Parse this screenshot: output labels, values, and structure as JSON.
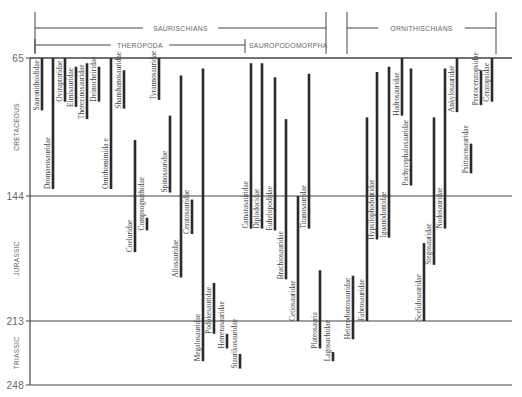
{
  "chart_data": {
    "type": "range-bar",
    "title": "",
    "xlabel": "",
    "ylabel": "Millions of years ago",
    "ylim": [
      65,
      248
    ],
    "y_ticks": [
      65,
      144,
      213,
      248
    ],
    "periods": [
      {
        "name": "CRETACEOUS",
        "from": 65,
        "to": 144
      },
      {
        "name": "JURASSIC",
        "from": 144,
        "to": 213
      },
      {
        "name": "TRIASSIC",
        "from": 213,
        "to": 248
      }
    ],
    "groups": [
      {
        "name": "SAURISCHIANS",
        "x_from": 35,
        "x_to": 326,
        "level": 1
      },
      {
        "name": "THEROPODA",
        "x_from": 35,
        "x_to": 245,
        "level": 2
      },
      {
        "name": "SAUROPODOMORPHA",
        "x_from": 245,
        "x_to": 326,
        "level": 2
      },
      {
        "name": "ORNITHISCHIANS",
        "x_from": 347,
        "x_to": 496,
        "level": 1
      }
    ],
    "families": [
      {
        "name": "Sauronithoididae",
        "x": 42,
        "from": 65,
        "to": 95,
        "group": "THEROPODA"
      },
      {
        "name": "Dromaeosauridae",
        "x": 53,
        "from": 65,
        "to": 140,
        "group": "THEROPODA"
      },
      {
        "name": "Oviraptoridae",
        "x": 65,
        "from": 65,
        "to": 90,
        "group": "THEROPODA"
      },
      {
        "name": "Elmisauridae",
        "x": 76,
        "from": 70,
        "to": 93,
        "group": "THEROPODA"
      },
      {
        "name": "Therezinosauridae",
        "x": 87,
        "from": 68,
        "to": 100,
        "group": "THEROPODA"
      },
      {
        "name": "Deinocheiridae",
        "x": 99,
        "from": 70,
        "to": 90,
        "group": "THEROPODA"
      },
      {
        "name": "Ornithomimida e",
        "x": 111,
        "from": 65,
        "to": 140,
        "group": "THEROPODA"
      },
      {
        "name": "Shanshanosauridae",
        "x": 124,
        "from": 72,
        "to": 94,
        "group": "THEROPODA"
      },
      {
        "name": "Coeluridae",
        "x": 135,
        "from": 112,
        "to": 175,
        "group": "THEROPODA"
      },
      {
        "name": "Compsognathidae",
        "x": 147,
        "from": 156,
        "to": 163,
        "group": "THEROPODA"
      },
      {
        "name": "Tyrannosauridae",
        "x": 159,
        "from": 65,
        "to": 89,
        "group": "THEROPODA"
      },
      {
        "name": "Spinosauridae",
        "x": 170,
        "from": 98,
        "to": 142,
        "group": "THEROPODA"
      },
      {
        "name": "Allosauridae",
        "x": 181,
        "from": 75,
        "to": 189,
        "group": "THEROPODA"
      },
      {
        "name": "Ceratosauridae",
        "x": 192,
        "from": 146,
        "to": 165,
        "group": "THEROPODA"
      },
      {
        "name": "Megalosauridae",
        "x": 203,
        "from": 71,
        "to": 235,
        "group": "THEROPODA"
      },
      {
        "name": "Podokesauridae",
        "x": 214,
        "from": 192,
        "to": 220,
        "group": "THEROPODA"
      },
      {
        "name": "Herrerasauridae",
        "x": 227,
        "from": 220,
        "to": 228,
        "group": "THEROPODA"
      },
      {
        "name": "Staurikosauridae",
        "x": 240,
        "from": 231,
        "to": 239,
        "group": "THEROPODA"
      },
      {
        "name": "Camarasauridae",
        "x": 251,
        "from": 68,
        "to": 162,
        "group": "SAUROPODOMORPHA"
      },
      {
        "name": "Diplodocidae",
        "x": 262,
        "from": 68,
        "to": 162,
        "group": "SAUROPODOMORPHA"
      },
      {
        "name": "Euhelopodidae",
        "x": 275,
        "from": 76,
        "to": 163,
        "group": "SAUROPODOMORPHA"
      },
      {
        "name": "Brachiosauridae",
        "x": 286,
        "from": 100,
        "to": 190,
        "group": "SAUROPODOMORPHA"
      },
      {
        "name": "Cetiosauridae",
        "x": 298,
        "from": 144,
        "to": 213,
        "group": "SAUROPODOMORPHA"
      },
      {
        "name": "Titanosauridae",
        "x": 309,
        "from": 74,
        "to": 162,
        "group": "SAUROPODOMORPHA"
      },
      {
        "name": "Plateosauria",
        "x": 320,
        "from": 185,
        "to": 228,
        "group": "SAUROPODOMORPHA"
      },
      {
        "name": "Lagosuchidae",
        "x": 333,
        "from": 230,
        "to": 235,
        "group": "SAUROPODOMORPHA"
      },
      {
        "name": "Heterodontosauridae",
        "x": 353,
        "from": 188,
        "to": 223,
        "group": "ORNITHISCHIA"
      },
      {
        "name": "Fabrosauridae",
        "x": 367,
        "from": 99,
        "to": 213,
        "group": "ORNITHISCHIA"
      },
      {
        "name": "Hypsilophodontidae",
        "x": 377,
        "from": 73,
        "to": 168,
        "group": "ORNITHISCHIA"
      },
      {
        "name": "Iguanodontidae",
        "x": 389,
        "from": 70,
        "to": 167,
        "group": "ORNITHISCHIA"
      },
      {
        "name": "Hadrosauridae",
        "x": 402,
        "from": 65,
        "to": 98,
        "group": "ORNITHISCHIA"
      },
      {
        "name": "Pachycephalosauridae",
        "x": 411,
        "from": 71,
        "to": 138,
        "group": "ORNITHISCHIA"
      },
      {
        "name": "Scelidosauridae",
        "x": 424,
        "from": 170,
        "to": 213,
        "group": "ORNITHISCHIA"
      },
      {
        "name": "Stegosauridae",
        "x": 434,
        "from": 99,
        "to": 182,
        "group": "ORNITHISCHIA"
      },
      {
        "name": "Nodosauridae",
        "x": 445,
        "from": 71,
        "to": 162,
        "group": "ORNITHISCHIA"
      },
      {
        "name": "Ankylosauridae",
        "x": 457,
        "from": 65,
        "to": 96,
        "group": "ORNITHISCHIA"
      },
      {
        "name": "Psittacosauridae",
        "x": 471,
        "from": 114,
        "to": 131,
        "group": "ORNITHISCHIA"
      },
      {
        "name": "Protoceratopsidae",
        "x": 481,
        "from": 72,
        "to": 92,
        "group": "ORNITHISCHIA"
      },
      {
        "name": "Ceratopsidae",
        "x": 492,
        "from": 65,
        "to": 90,
        "group": "ORNITHISCHIA"
      }
    ]
  }
}
